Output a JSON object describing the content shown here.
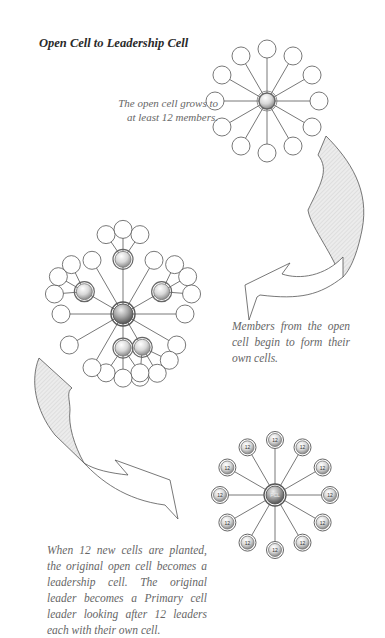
{
  "title": "Open Cell to Leadership Cell",
  "captions": {
    "open_cell": "The open cell grows to at least 12 members.",
    "members": "Members from the open cell begin to form their own cells.",
    "leadership": "When 12 new cells are planted, the original open cell becomes a leadership cell. The original leader becomes a Primary cell leader looking after 12 leaders each with their own cell."
  },
  "diagrams": {
    "open_cell": {
      "center_label": "",
      "member_count": 12
    },
    "multiplying_cell": {
      "center_label": "",
      "member_count": 12,
      "new_leaders": 5
    },
    "leadership_cell": {
      "center_label": "PCL",
      "node_label": "12",
      "node_count": 12
    }
  },
  "colors": {
    "line": "#555555",
    "arrow_fill": "#e6e6e6",
    "text": "#666666"
  }
}
